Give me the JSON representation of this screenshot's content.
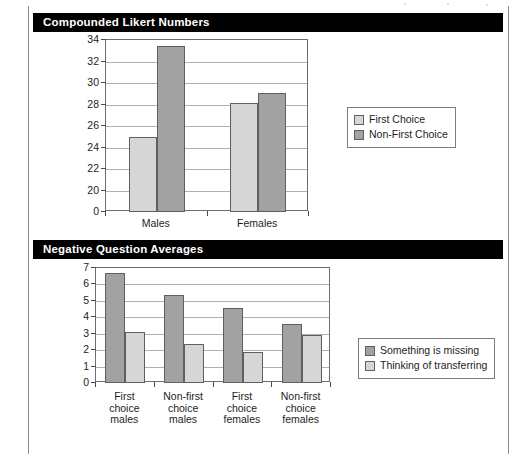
{
  "page": {
    "background_color": "#ffffff",
    "border_color": "#8d8d8d"
  },
  "figures": [
    {
      "id": "compounded-likert-numbers",
      "title": "Compounded Likert Numbers",
      "title_bar_color": "#000000",
      "title_text_color": "#ffffff",
      "legend_position": "right",
      "chart_data": {
        "type": "bar",
        "title": "Compounded Likert Numbers",
        "xlabel": "",
        "ylabel": "",
        "categories": [
          "Males",
          "Females"
        ],
        "series": [
          {
            "name": "First Choice",
            "color": "#d6d6d6",
            "values": [
              24.95,
              28.1
            ]
          },
          {
            "name": "Non-First Choice",
            "color": "#a2a2a2",
            "values": [
              33.4,
              29.05
            ]
          }
        ],
        "yticks": [
          "34",
          "32",
          "30",
          "28",
          "26",
          "24",
          "22",
          "20",
          "0"
        ],
        "ytick_values": [
          34,
          32,
          30,
          28,
          26,
          24,
          22,
          20,
          0
        ],
        "ylim": [
          20,
          34
        ],
        "axis_break": true,
        "grid": true
      }
    },
    {
      "id": "negative-question-averages",
      "title": "Negative Question Averages",
      "title_bar_color": "#000000",
      "title_text_color": "#ffffff",
      "legend_position": "right",
      "chart_data": {
        "type": "bar",
        "title": "Negative Question Averages",
        "xlabel": "",
        "ylabel": "",
        "categories": [
          "First\nchoice\nmales",
          "Non-first\nchoice\nmales",
          "First\nchoice\nfemales",
          "Non-first\nchoice\nfemales"
        ],
        "series": [
          {
            "name": "Something is missing",
            "color": "#a2a2a2",
            "values": [
              6.7,
              5.35,
              4.55,
              3.6
            ]
          },
          {
            "name": "Thinking of transferring",
            "color": "#d6d6d6",
            "values": [
              3.1,
              2.4,
              1.9,
              2.9
            ]
          }
        ],
        "yticks": [
          "7",
          "6",
          "5",
          "4",
          "3",
          "2",
          "1",
          "0"
        ],
        "ytick_values": [
          7,
          6,
          5,
          4,
          3,
          2,
          1,
          0
        ],
        "ylim": [
          0,
          7
        ],
        "grid": true
      }
    }
  ]
}
